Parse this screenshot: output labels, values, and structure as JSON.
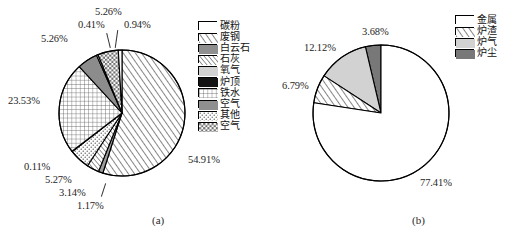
{
  "figure": {
    "background": "#ffffff",
    "width": 520,
    "height": 238
  },
  "panels": [
    {
      "id": "a",
      "caption": "(a)",
      "center": {
        "x": 122,
        "y": 113
      },
      "radius": 63,
      "legend_position": "right",
      "legend_origin": {
        "x": 198,
        "y": 20
      }
    },
    {
      "id": "b",
      "caption": "(b)",
      "center": {
        "x": 381,
        "y": 113
      },
      "radius": 68,
      "legend_position": "right",
      "legend_origin": {
        "x": 455,
        "y": 14
      }
    }
  ],
  "chart_data": [
    {
      "type": "pie",
      "title": "",
      "panel": "(a)",
      "start_angle_deg": 90,
      "direction": "clockwise",
      "unit": "%",
      "legend_position": "right",
      "categories": [
        "碳粉",
        "废钢",
        "白云石",
        "石灰",
        "氧气",
        "炉顶",
        "铁水",
        "空气",
        "其他",
        "空气"
      ],
      "labels": [
        "54.91%",
        "1.17%",
        "3.14%",
        "5.27%",
        "0.11%",
        "23.53%",
        "5.26%",
        "0.41%",
        "5.26%",
        "0.94%"
      ],
      "values": [
        54.91,
        1.17,
        3.14,
        5.27,
        0.11,
        23.53,
        5.26,
        0.41,
        5.26,
        0.94
      ],
      "slices": [
        {
          "name": "废钢",
          "value": 54.91,
          "label": "54.91%",
          "pattern": "diagonal-hatch-right",
          "fill": "#ffffff",
          "stroke": "#000000",
          "label_pos": {
            "x": 188,
            "y": 154
          }
        },
        {
          "name": "空气",
          "value": 1.17,
          "label": "1.17%",
          "pattern": "solid-gray",
          "fill": "#9a9a9a",
          "stroke": "#000000",
          "label_pos": {
            "x": 77,
            "y": 200
          }
        },
        {
          "name": "石灰",
          "value": 3.14,
          "label": "3.14%",
          "pattern": "diagonal-hatch-right-fine",
          "fill": "#ffffff",
          "stroke": "#000000",
          "label_pos": {
            "x": 59,
            "y": 187
          }
        },
        {
          "name": "其他",
          "value": 5.27,
          "label": "5.27%",
          "pattern": "dots",
          "fill": "#ffffff",
          "stroke": "#000000",
          "label_pos": {
            "x": 45,
            "y": 174
          }
        },
        {
          "name": "炉顶",
          "value": 0.11,
          "label": "0.11%",
          "pattern": "solid-black",
          "fill": "#111111",
          "stroke": "#000000",
          "label_pos": {
            "x": 24,
            "y": 161
          }
        },
        {
          "name": "铁水",
          "value": 23.53,
          "label": "23.53%",
          "pattern": "grid",
          "fill": "#ffffff",
          "stroke": "#000000",
          "label_pos": {
            "x": 8,
            "y": 95
          }
        },
        {
          "name": "白云石",
          "value": 5.26,
          "label": "5.26%",
          "pattern": "solid-gray",
          "fill": "#8c8c8c",
          "stroke": "#000000",
          "label_pos": {
            "x": 41,
            "y": 33
          }
        },
        {
          "name": "氧气",
          "value": 0.41,
          "label": "0.41%",
          "pattern": "light-gray",
          "fill": "#cfcfcf",
          "stroke": "#000000",
          "label_pos": {
            "x": 78,
            "y": 19
          }
        },
        {
          "name": "空气",
          "value": 5.26,
          "label": "5.26%",
          "pattern": "checker",
          "fill": "#ffffff",
          "stroke": "#000000",
          "label_pos": {
            "x": 95,
            "y": 6
          }
        },
        {
          "name": "碳粉",
          "value": 0.94,
          "label": "0.94%",
          "pattern": "white",
          "fill": "#ffffff",
          "stroke": "#000000",
          "label_pos": {
            "x": 124,
            "y": 19
          }
        }
      ],
      "legend": [
        {
          "label": "碳粉",
          "pattern": "white"
        },
        {
          "label": "废钢",
          "pattern": "diagonal-hatch-right"
        },
        {
          "label": "白云石",
          "pattern": "solid-gray"
        },
        {
          "label": "石灰",
          "pattern": "diagonal-hatch-right-fine"
        },
        {
          "label": "氧气",
          "pattern": "light-gray"
        },
        {
          "label": "炉顶",
          "pattern": "solid-black"
        },
        {
          "label": "铁水",
          "pattern": "grid"
        },
        {
          "label": "空气",
          "pattern": "solid-gray"
        },
        {
          "label": "其他",
          "pattern": "dots"
        },
        {
          "label": "空气",
          "pattern": "checker"
        }
      ]
    },
    {
      "type": "pie",
      "title": "",
      "panel": "(b)",
      "start_angle_deg": 90,
      "direction": "counterclockwise",
      "unit": "%",
      "legend_position": "right",
      "categories": [
        "金属",
        "炉渣",
        "炉气",
        "炉尘"
      ],
      "labels": [
        "77.41%",
        "6.79%",
        "12.12%",
        "3.68%"
      ],
      "values": [
        77.41,
        6.79,
        12.12,
        3.68
      ],
      "slices": [
        {
          "name": "炉尘",
          "value": 3.68,
          "label": "3.68%",
          "pattern": "dark-gray",
          "fill": "#787878",
          "stroke": "#000000",
          "label_pos": {
            "x": 362,
            "y": 26
          }
        },
        {
          "name": "炉气",
          "value": 12.12,
          "label": "12.12%",
          "pattern": "light-gray",
          "fill": "#d2d2d2",
          "stroke": "#000000",
          "label_pos": {
            "x": 304,
            "y": 42
          }
        },
        {
          "name": "炉渣",
          "value": 6.79,
          "label": "6.79%",
          "pattern": "diagonal-hatch-right",
          "fill": "#ffffff",
          "stroke": "#000000",
          "label_pos": {
            "x": 282,
            "y": 80
          }
        },
        {
          "name": "金属",
          "value": 77.41,
          "label": "77.41%",
          "pattern": "white",
          "fill": "#ffffff",
          "stroke": "#000000",
          "label_pos": {
            "x": 420,
            "y": 177
          }
        }
      ],
      "legend": [
        {
          "label": "金属",
          "pattern": "white"
        },
        {
          "label": "炉渣",
          "pattern": "diagonal-hatch-right"
        },
        {
          "label": "炉气",
          "pattern": "light-gray"
        },
        {
          "label": "炉尘",
          "pattern": "dark-gray"
        }
      ]
    }
  ]
}
